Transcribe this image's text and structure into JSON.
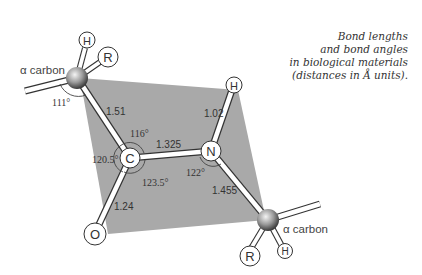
{
  "caption": {
    "lines": [
      "Bond  lengths",
      "and bond  angles",
      "in biological materials",
      "(distances in Å units)."
    ]
  },
  "atoms": {
    "alpha_carbon_1": {
      "label": "α carbon",
      "substituents": [
        "H",
        "R"
      ]
    },
    "carbonyl_carbon": "C",
    "oxygen": "O",
    "nitrogen": "N",
    "amide_hydrogen": "H",
    "alpha_carbon_2": {
      "label": "α carbon",
      "substituents": [
        "R",
        "H"
      ]
    }
  },
  "bond_lengths": {
    "calpha_c": "1.51",
    "c_n": "1.325",
    "c_o": "1.24",
    "n_h": "1.02",
    "n_calpha": "1.455"
  },
  "bond_angles": {
    "calpha1": "111°",
    "c_top": "116°",
    "c_left": "120.5°",
    "c_bottom": "123.5°",
    "n": "122°"
  },
  "colors": {
    "plane": "#a9a9a9",
    "bond_outline": "#333333",
    "text": "#444444"
  }
}
